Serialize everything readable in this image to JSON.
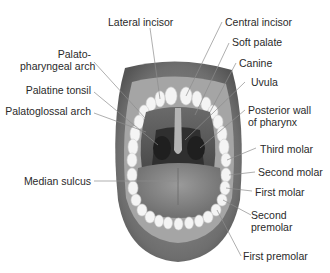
{
  "diagram": {
    "labels_left": [
      {
        "id": "lateral-incisor",
        "text": "Lateral incisor"
      },
      {
        "id": "palatopharyngeal-arch",
        "line1": "Palato-",
        "line2": "pharyngeal arch"
      },
      {
        "id": "palatine-tonsil",
        "text": "Palatine tonsil"
      },
      {
        "id": "palatoglossal-arch",
        "text": "Palatoglossal arch"
      },
      {
        "id": "median-sulcus",
        "text": "Median sulcus"
      }
    ],
    "labels_right": [
      {
        "id": "central-incisor",
        "text": "Central incisor"
      },
      {
        "id": "soft-palate",
        "text": "Soft palate"
      },
      {
        "id": "canine",
        "text": "Canine"
      },
      {
        "id": "uvula",
        "text": "Uvula"
      },
      {
        "id": "posterior-wall-of-pharynx",
        "line1": "Posterior wall",
        "line2": "of pharynx"
      },
      {
        "id": "third-molar",
        "text": "Third molar"
      },
      {
        "id": "second-molar",
        "text": "Second molar"
      },
      {
        "id": "first-molar",
        "text": "First molar"
      },
      {
        "id": "second-premolar",
        "line1": "Second",
        "line2": "premolar"
      },
      {
        "id": "first-premolar",
        "text": "First premolar"
      }
    ],
    "colors": {
      "lip": "#7a7a7a",
      "lip_dark": "#5a5a5a",
      "gum": "#9a9a9a",
      "teeth": "#f2f2f2",
      "throat": "#3a3a3a",
      "tongue": "#8a8a8a",
      "leader": "#8c8c8c",
      "text": "#2a2a2a"
    }
  }
}
